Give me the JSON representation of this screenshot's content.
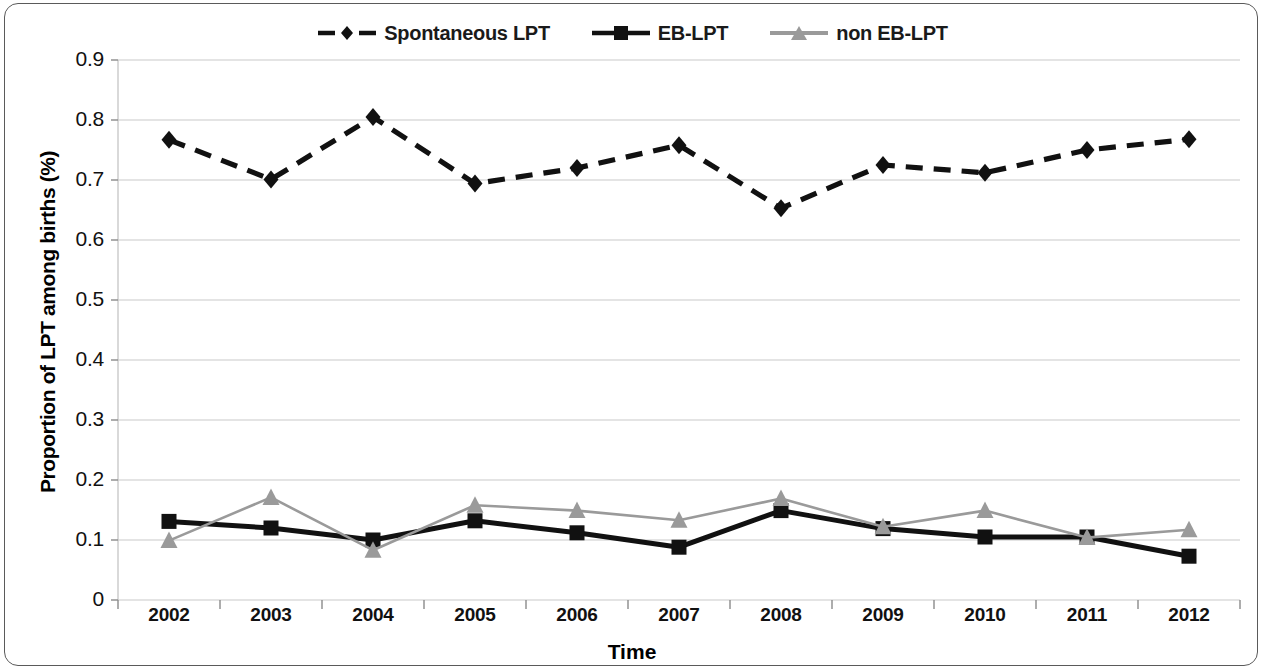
{
  "chart_data": {
    "type": "line",
    "title": "",
    "xlabel": "Time",
    "ylabel": "Proportion of LPT among births (%)",
    "categories": [
      "2002",
      "2003",
      "2004",
      "2005",
      "2006",
      "2007",
      "2008",
      "2009",
      "2010",
      "2011",
      "2012"
    ],
    "x_tick_labels": [
      "2002",
      "2003",
      "2004",
      "2005",
      "2006",
      "2007",
      "2008",
      "2009",
      "2010",
      "2011",
      "2012"
    ],
    "y_tick_labels": [
      "0.9",
      "0.8",
      "0.7",
      "0.6",
      "0.5",
      "0.4",
      "0.3",
      "0.2",
      "0.1",
      "0"
    ],
    "y_tick_values": [
      0.9,
      0.8,
      0.7,
      0.6,
      0.5,
      0.4,
      0.3,
      0.2,
      0.1,
      0
    ],
    "ylim": [
      0,
      0.9
    ],
    "grid": true,
    "legend_position": "top-center",
    "series": [
      {
        "name": "Spontaneous LPT",
        "marker": "diamond",
        "line_style": "dashed",
        "color": "#111111",
        "values": [
          0.767,
          0.701,
          0.805,
          0.694,
          0.72,
          0.758,
          0.653,
          0.725,
          0.712,
          0.75,
          0.768
        ]
      },
      {
        "name": "EB-LPT",
        "marker": "square",
        "line_style": "solid",
        "color": "#111111",
        "values": [
          0.131,
          0.12,
          0.1,
          0.132,
          0.112,
          0.088,
          0.149,
          0.119,
          0.105,
          0.105,
          0.073
        ]
      },
      {
        "name": "non EB-LPT",
        "marker": "triangle",
        "line_style": "solid",
        "color": "#9a9a9a",
        "values": [
          0.099,
          0.171,
          0.083,
          0.158,
          0.149,
          0.133,
          0.169,
          0.122,
          0.149,
          0.104,
          0.117
        ]
      }
    ]
  },
  "legend": {
    "items": [
      {
        "label": "Spontaneous LPT",
        "marker": "diamond-marker-icon"
      },
      {
        "label": "EB-LPT",
        "marker": "square-marker-icon"
      },
      {
        "label": "non EB-LPT",
        "marker": "triangle-marker-icon"
      }
    ]
  },
  "axes": {
    "y_title": "Proportion of LPT among births (%)",
    "x_title": "Time"
  },
  "colors": {
    "dark": "#111111",
    "light_gray": "#9a9a9a",
    "grid": "#c9c9c9",
    "frame": "#5a5a5a"
  }
}
